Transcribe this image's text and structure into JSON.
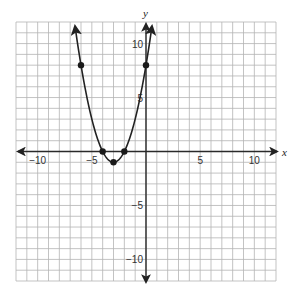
{
  "chart_data": {
    "type": "line",
    "title": "",
    "xlabel": "x",
    "ylabel": "y",
    "xlim": [
      -12,
      12
    ],
    "ylim": [
      -12,
      12
    ],
    "grid": true,
    "grid_step": 1,
    "x_ticks": [
      {
        "value": -10,
        "label": "−10"
      },
      {
        "value": -5,
        "label": "−5"
      },
      {
        "value": 5,
        "label": "5"
      },
      {
        "value": 10,
        "label": "10"
      }
    ],
    "y_ticks": [
      {
        "value": 10,
        "label": "10"
      },
      {
        "value": 5,
        "label": "5"
      },
      {
        "value": -5,
        "label": "−5"
      },
      {
        "value": -10,
        "label": "−10"
      }
    ],
    "series": [
      {
        "name": "parabola",
        "equation": "y = x^2 + 6x + 8",
        "curve_x_range": [
          -6.55,
          0.55
        ],
        "arrows_both_ends": true,
        "points": [
          {
            "x": -6,
            "y": 8
          },
          {
            "x": -4,
            "y": 0
          },
          {
            "x": -3,
            "y": -1
          },
          {
            "x": -2,
            "y": 0
          },
          {
            "x": 0,
            "y": 8
          }
        ]
      }
    ],
    "colors": {
      "grid": "#b4b4b4",
      "axis": "#2a2a2a",
      "curve": "#222222",
      "points": "#1a1a1a"
    }
  }
}
